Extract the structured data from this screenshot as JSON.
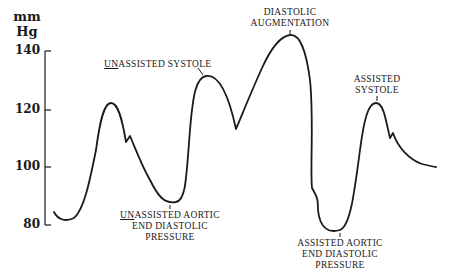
{
  "diagram": {
    "type": "arterial pressure waveform (intra-aortic balloon pump)",
    "y_axis": {
      "unit_line1": "mm",
      "unit_line2": "Hg",
      "ticks": [
        "140",
        "120",
        "100",
        "80"
      ]
    },
    "labels": {
      "unassisted_systole": {
        "underlined": "UN",
        "rest": "ASSISTED SYSTOLE"
      },
      "diastolic_augmentation": {
        "line1": "DIASTOLIC",
        "line2": "AUGMENTATION"
      },
      "assisted_systole": {
        "line1": "ASSISTED",
        "line2": "SYSTOLE"
      },
      "unassisted_aortic_edp": {
        "underlined": "UN",
        "line1_rest": "ASSISTED AORTIC",
        "line2": "END DIASTOLIC",
        "line3": "PRESSURE"
      },
      "assisted_aortic_edp": {
        "line1": "ASSISTED AORTIC",
        "line2": "END DIASTOLIC",
        "line3": "PRESSURE"
      }
    },
    "colors": {
      "ink": "#1a1a1a",
      "background": "#ffffff"
    }
  }
}
